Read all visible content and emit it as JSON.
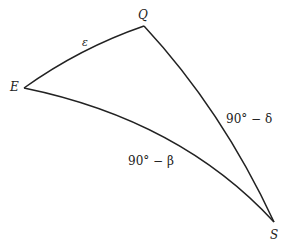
{
  "diagram": {
    "type": "spherical-triangle",
    "vertices": [
      {
        "id": "E",
        "label": "E",
        "x": 24,
        "y": 88
      },
      {
        "id": "Q",
        "label": "Q",
        "x": 144,
        "y": 26
      },
      {
        "id": "S",
        "label": "S",
        "x": 274,
        "y": 222
      }
    ],
    "sides": [
      {
        "from": "E",
        "to": "Q",
        "label": "ε"
      },
      {
        "from": "Q",
        "to": "S",
        "label": "90° − δ"
      },
      {
        "from": "E",
        "to": "S",
        "label": "90° − β"
      }
    ],
    "line_color": "#222222"
  }
}
